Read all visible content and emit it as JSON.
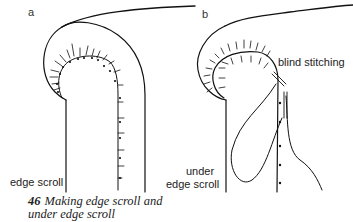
{
  "panels": [
    {
      "letter": "a",
      "labels": [
        "edge scroll"
      ]
    },
    {
      "letter": "b",
      "labels": [
        "blind stitching",
        "under",
        "edge scroll"
      ]
    }
  ],
  "caption": {
    "number": "46",
    "line1": "Making edge scroll and",
    "line2": "under edge scroll"
  }
}
